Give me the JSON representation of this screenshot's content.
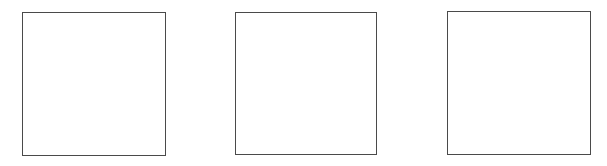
{
  "diagram": {
    "background": "#ffffff",
    "stroke_color": "#4a4a4a",
    "boxes": [
      {
        "id": "box-1",
        "x": 22,
        "y": 12,
        "width": 144,
        "height": 144,
        "label": ""
      },
      {
        "id": "box-2",
        "x": 235,
        "y": 12,
        "width": 142,
        "height": 143,
        "label": ""
      },
      {
        "id": "box-3",
        "x": 447,
        "y": 11,
        "width": 144,
        "height": 144,
        "label": ""
      }
    ]
  }
}
